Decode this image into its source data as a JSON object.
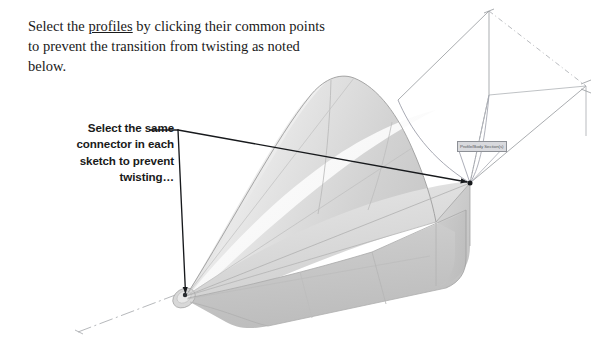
{
  "document": {
    "background_color": "#ffffff",
    "width": 597,
    "height": 341
  },
  "annotations": {
    "primary_note": {
      "line1_before": "Select the ",
      "line1_emphasis": "profiles",
      "line1_after": " by clicking their common",
      "line2": "points to prevent the transition from",
      "line3": "twisting as noted below.",
      "style": "serif",
      "color": "#1a1a1a"
    },
    "secondary_note": {
      "line1": "Select the same",
      "line2": "connector in each",
      "line3": "sketch to prevent",
      "line4": "twisting…",
      "style": "sans-serif",
      "align": "right",
      "color": "#1a1a1a"
    },
    "cad_tooltip": {
      "text": "Profile/Body Section(s)",
      "fill_color": "#d9dade",
      "border_color": "#8d9096",
      "text_color": "#55585c"
    }
  },
  "leader": {
    "color": "#17191c",
    "stroke_width": 1.4,
    "anchor_x": 178,
    "anchor_y": 130,
    "text_stub_x": 150,
    "target_left_x": 186,
    "target_left_y": 296,
    "target_right_x": 470,
    "target_right_y": 183
  },
  "model": {
    "name": "lofted-transition-cone-to-rectangle",
    "description": "Shaded 3D loft transitioning from a small round end at lower-left to a large rounded-rectangle end at right",
    "colors": {
      "surface_highlight": "#fefefe",
      "surface_light": "#ededed",
      "surface_mid": "#d6d6d6",
      "surface_dark": "#c2c2c2",
      "surface_shadow": "#b0b0b0",
      "edge_line": "#9a9a9a",
      "sketch_line": "#8f9296",
      "centerline": "#a6a8ac"
    }
  },
  "geometry": {
    "small_end": {
      "x": 186,
      "y": 296
    },
    "large_end_top_vertex": {
      "x": 470,
      "y": 183
    },
    "apex_top": {
      "x": 333,
      "y": 78
    },
    "sketch_plane_top_right": {
      "x": 489,
      "y": 10
    },
    "sketch_plane_right": {
      "x": 586,
      "y": 86
    }
  }
}
